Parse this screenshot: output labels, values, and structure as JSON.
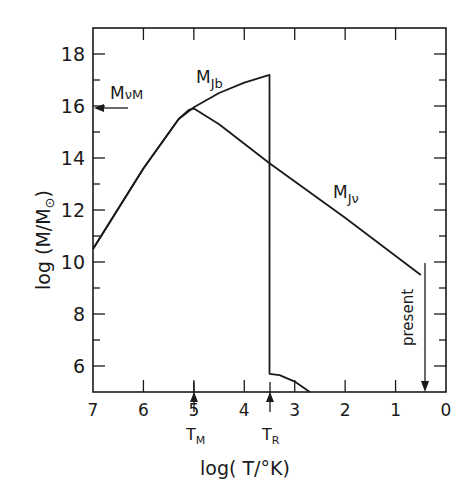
{
  "chart_data": {
    "type": "line",
    "title": "",
    "xlabel": "log(T/°K)",
    "ylabel": "log(M/M⊙)",
    "xlim": [
      7,
      0
    ],
    "ylim": [
      5,
      19
    ],
    "x_ticks": [
      7,
      6,
      5,
      4,
      3,
      2,
      1,
      0
    ],
    "x_tick_labels": [
      "7",
      "6",
      "5",
      "4",
      "3",
      "2",
      "1",
      "0"
    ],
    "y_ticks": [
      6,
      8,
      10,
      12,
      14,
      16,
      18
    ],
    "y_tick_labels": [
      "6",
      "8",
      "10",
      "12",
      "14",
      "16",
      "18"
    ],
    "grid": false,
    "series": [
      {
        "name": "M_Jb",
        "label_main": "M",
        "label_sub": "Jb",
        "x": [
          7.0,
          6.0,
          5.3,
          5.0,
          4.5,
          4.0,
          3.5,
          3.5,
          3.3,
          3.0,
          2.7
        ],
        "y": [
          10.5,
          13.6,
          15.5,
          15.95,
          16.5,
          16.9,
          17.2,
          5.7,
          5.65,
          5.4,
          5.0
        ]
      },
      {
        "name": "M_Jv",
        "label_main": "M",
        "label_sub": "Jν",
        "x": [
          7.0,
          6.0,
          5.3,
          5.1,
          5.0,
          4.5,
          3.5,
          2.0,
          0.5
        ],
        "y": [
          10.5,
          13.6,
          15.5,
          15.85,
          15.9,
          15.3,
          13.8,
          11.7,
          9.5
        ]
      }
    ],
    "annotations": [
      {
        "text": "M",
        "sub": "νM",
        "type": "arrow-to-y-axis",
        "y": 16
      },
      {
        "text": "T",
        "sub": "M",
        "type": "arrow-up",
        "x": 5.0
      },
      {
        "text": "T",
        "sub": "R",
        "type": "arrow-up",
        "x": 3.5
      },
      {
        "text": "present",
        "type": "arrow-down",
        "x": 0.5
      }
    ]
  },
  "labels": {
    "ylabel_main": "log (M/M",
    "ylabel_sym": "⊙",
    "ylabel_close": ")",
    "xlabel": "log( T/°K)",
    "mjb_main": "M",
    "mjb_sub": "Jb",
    "mjv_main": "M",
    "mjv_sub": "Jν",
    "mvm_main": "M",
    "mvm_sub": "νM",
    "tm_main": "T",
    "tm_sub": "M",
    "tr_main": "T",
    "tr_sub": "R",
    "present": "present"
  }
}
